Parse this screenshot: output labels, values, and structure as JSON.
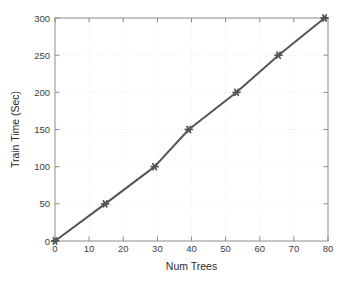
{
  "chart_data": {
    "type": "line",
    "title": "",
    "xlabel": "Num Trees",
    "ylabel": "Train Time (Sec)",
    "xlim": [
      0,
      80
    ],
    "ylim": [
      0,
      300
    ],
    "xticks": [
      0,
      10,
      20,
      30,
      40,
      50,
      60,
      70,
      80
    ],
    "xticklabels": [
      "0",
      "10",
      "20",
      "30",
      "40",
      "50",
      "60",
      "70",
      "80"
    ],
    "yticks": [
      0,
      50,
      100,
      150,
      200,
      250,
      300
    ],
    "yticklabels": [
      "0",
      "50",
      "100",
      "150",
      "200",
      "250",
      "300"
    ],
    "grid": true,
    "grid_style": "dotted",
    "legend": null,
    "series": [
      {
        "name": "Train Time",
        "marker": "star",
        "line_color": "#555555",
        "marker_color": "#555555",
        "x": [
          0,
          14.7,
          29.2,
          39.2,
          53.2,
          65.5,
          79
        ],
        "y": [
          0,
          50,
          100,
          150,
          200,
          250,
          300
        ]
      }
    ]
  },
  "axes": {
    "x_title": "Num Trees",
    "y_title": "Train Time (Sec)",
    "x_tick_0": "0",
    "x_tick_1": "10",
    "x_tick_2": "20",
    "x_tick_3": "30",
    "x_tick_4": "40",
    "x_tick_5": "50",
    "x_tick_6": "60",
    "x_tick_7": "70",
    "x_tick_8": "80",
    "y_tick_0": "0",
    "y_tick_1": "50",
    "y_tick_2": "100",
    "y_tick_3": "150",
    "y_tick_4": "200",
    "y_tick_5": "250",
    "y_tick_6": "300"
  },
  "colors": {
    "background": "#ffffff",
    "axis": "#8c8c8c",
    "grid": "#ededed",
    "data": "#555555",
    "text": "#333333"
  }
}
